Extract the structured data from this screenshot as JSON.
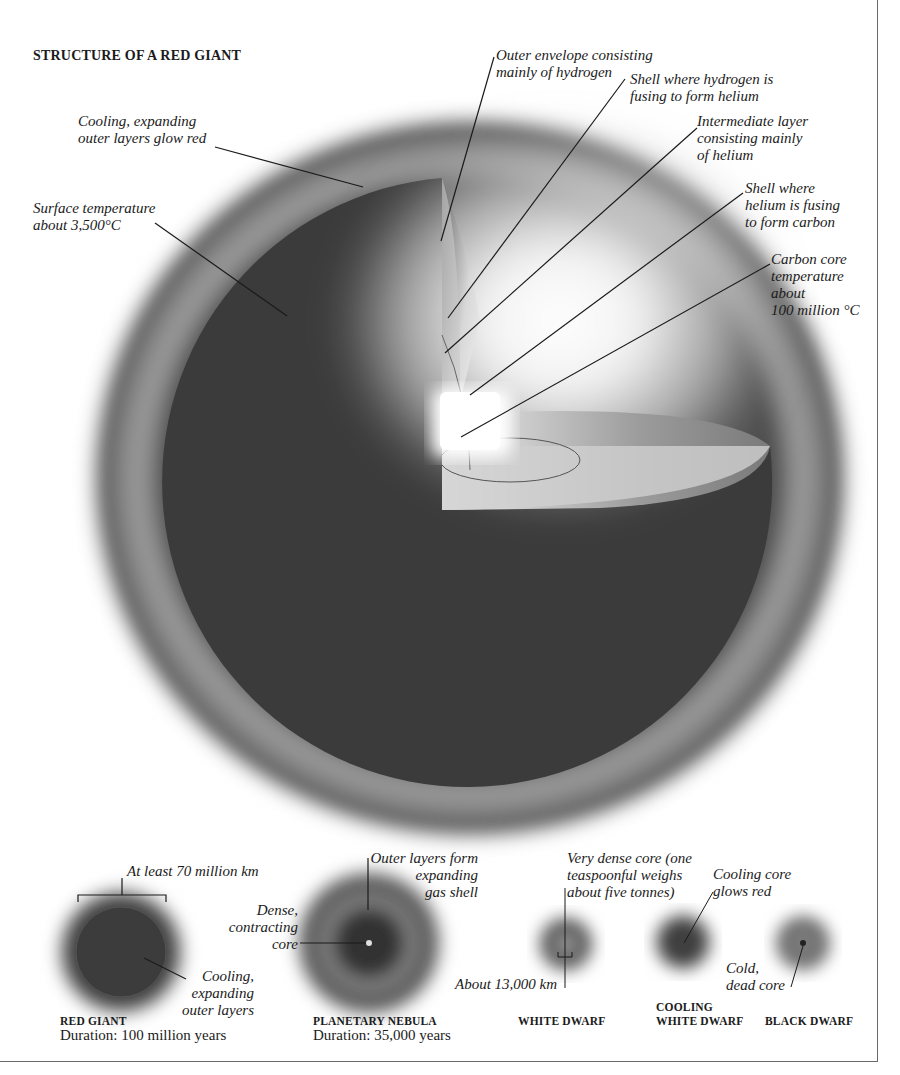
{
  "title": "STRUCTURE OF A RED GIANT",
  "main_labels": {
    "cooling_outer": "Cooling, expanding\nouter layers glow red",
    "surface_temp": "Surface temperature\nabout 3,500°C",
    "outer_envelope": "Outer envelope consisting\nmainly of hydrogen",
    "hydrogen_shell": "Shell where hydrogen is\nfusing to form helium",
    "intermediate": "Intermediate layer\nconsisting mainly\nof helium",
    "helium_shell": "Shell where\nhelium is fusing\nto form carbon",
    "carbon_core": "Carbon core\ntemperature\nabout\n100 million °C"
  },
  "stages": [
    {
      "name": "RED GIANT",
      "duration": "Duration: 100 million years",
      "labels": {
        "size": "At least 70 million km",
        "layers": "Cooling,\nexpanding\nouter layers"
      }
    },
    {
      "name": "PLANETARY NEBULA",
      "duration": "Duration: 35,000 years",
      "labels": {
        "core": "Dense,\ncontracting\ncore",
        "shell": "Outer layers form\nexpanding\ngas shell"
      }
    },
    {
      "name": "WHITE DWARF",
      "labels": {
        "core": "Very dense core (one\nteaspoonful weighs\nabout five tonnes)",
        "size": "About 13,000 km"
      }
    },
    {
      "name": "COOLING\nWHITE DWARF",
      "labels": {
        "core": "Cooling core\nglows red"
      }
    },
    {
      "name": "BLACK DWARF",
      "labels": {
        "core": "Cold,\ndead core"
      }
    }
  ],
  "colors": {
    "body": "#3d3d3d",
    "halo": "#5a5a5a",
    "glow": "#ffffff",
    "line": "#1b1b1b",
    "border": "#6a6a6a"
  }
}
